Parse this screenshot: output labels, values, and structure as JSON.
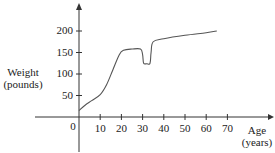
{
  "chart_data": {
    "type": "line",
    "title": "",
    "xlabel": "Age (years)",
    "xlabel_lines": [
      "Age",
      "(years)"
    ],
    "ylabel": "Weight (pounds)",
    "ylabel_lines": [
      "Weight",
      "(pounds)"
    ],
    "x_ticks": [
      0,
      10,
      20,
      30,
      40,
      50,
      60,
      70
    ],
    "y_ticks": [
      50,
      100,
      150,
      200
    ],
    "xlim": [
      0,
      75
    ],
    "ylim": [
      0,
      230
    ],
    "grid": false,
    "legend": null,
    "series": [
      {
        "name": "Weight",
        "x": [
          0,
          3,
          6,
          10,
          13,
          16,
          19,
          21,
          25,
          29,
          30,
          30.5,
          32,
          33.5,
          34,
          35,
          40,
          50,
          60,
          65
        ],
        "y": [
          15,
          28,
          38,
          52,
          75,
          110,
          145,
          155,
          158,
          158,
          145,
          125,
          124,
          125,
          150,
          175,
          182,
          190,
          196,
          200
        ]
      }
    ]
  }
}
